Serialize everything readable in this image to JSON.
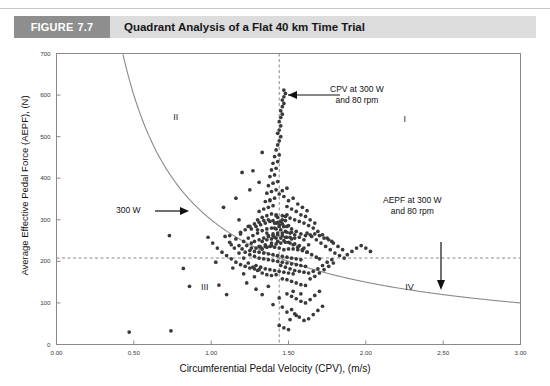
{
  "header": {
    "badge_word": "FIGURE",
    "badge_number": "7.7",
    "title": "Quadrant Analysis of a Flat 40 km Time Trial",
    "badge_color": "#8e8e8e",
    "band_color": "#dcdcdc"
  },
  "chart_data": {
    "type": "scatter",
    "title": "Quadrant Analysis of a Flat 40 km Time Trial",
    "xlabel": "Circumferential Pedal Velocity (CPV), (m/s)",
    "ylabel": "Average Effective Pedal Force (AEPF), (N)",
    "xlim": [
      0.0,
      3.0
    ],
    "ylim": [
      0,
      700
    ],
    "xticks": [
      "0.00",
      "0.50",
      "1.00",
      "1.50",
      "2.00",
      "2.50",
      "3.00"
    ],
    "xtick_values": [
      0.0,
      0.5,
      1.0,
      1.5,
      2.0,
      2.5,
      3.0
    ],
    "yticks": [
      "0",
      "100",
      "200",
      "300",
      "400",
      "500",
      "600",
      "700"
    ],
    "ytick_values": [
      0,
      100,
      200,
      300,
      400,
      500,
      600,
      700
    ],
    "grid": false,
    "legend": "none",
    "marker_color": "#3a3a3a",
    "marker_size_px": 2.6,
    "reference_lines": [
      {
        "name": "cpv-reference-line",
        "orientation": "vertical",
        "value": 1.44,
        "style": "dashed",
        "color": "#8a8a8a"
      },
      {
        "name": "aepf-reference-line",
        "orientation": "horizontal",
        "value": 208,
        "style": "dashed",
        "color": "#8a8a8a"
      }
    ],
    "curves": [
      {
        "name": "constant-power-300w",
        "label": "300 W",
        "equation": "AEPF = 300 / CPV",
        "power_watts": 300,
        "color": "#888888",
        "style": "solid"
      }
    ],
    "quadrant_labels": [
      {
        "label": "I",
        "cpv": 2.27,
        "aepf": 540
      },
      {
        "label": "II",
        "cpv": 0.78,
        "aepf": 545
      },
      {
        "label": "III",
        "cpv": 0.96,
        "aepf": 135
      },
      {
        "label": "IV",
        "cpv": 2.28,
        "aepf": 135
      }
    ],
    "annotations": [
      {
        "name": "cpv-annotation",
        "text_lines": [
          "CPV at 300 W",
          "and 80 rpm"
        ],
        "arrow": "left",
        "points_to": {
          "cpv": 1.44,
          "aepf": 595
        }
      },
      {
        "name": "aepf-annotation",
        "text_lines": [
          "AEPF at 300 W",
          "and 80 rpm"
        ],
        "arrow": "down",
        "points_to": {
          "cpv": 2.52,
          "aepf": 230
        }
      },
      {
        "name": "power-curve-annotation",
        "text_lines": [
          "300 W"
        ],
        "arrow": "right",
        "points_to": {
          "cpv": 0.8,
          "aepf": 300
        }
      }
    ],
    "points": [
      [
        0.47,
        30
      ],
      [
        0.74,
        33
      ],
      [
        0.86,
        140
      ],
      [
        1.05,
        143
      ],
      [
        0.73,
        262
      ],
      [
        0.82,
        183
      ],
      [
        1.03,
        198
      ],
      [
        1.14,
        184
      ],
      [
        1.21,
        170
      ],
      [
        1.28,
        163
      ],
      [
        1.1,
        120
      ],
      [
        1.33,
        120
      ],
      [
        1.4,
        96
      ],
      [
        1.46,
        90
      ],
      [
        1.49,
        78
      ],
      [
        1.52,
        84
      ],
      [
        1.55,
        70
      ],
      [
        1.51,
        60
      ],
      [
        1.44,
        112
      ],
      [
        1.37,
        140
      ],
      [
        1.29,
        133
      ],
      [
        1.23,
        148
      ],
      [
        1.53,
        128
      ],
      [
        1.58,
        122
      ],
      [
        1.12,
        262
      ],
      [
        1.18,
        300
      ],
      [
        1.08,
        330
      ],
      [
        1.16,
        352
      ],
      [
        1.25,
        372
      ],
      [
        1.2,
        414
      ],
      [
        1.27,
        418
      ],
      [
        1.33,
        462
      ],
      [
        1.31,
        390
      ],
      [
        1.38,
        346
      ],
      [
        1.42,
        310
      ],
      [
        1.46,
        300
      ],
      [
        1.41,
        258
      ],
      [
        1.36,
        268
      ],
      [
        1.3,
        276
      ],
      [
        1.24,
        284
      ],
      [
        1.19,
        270
      ],
      [
        1.13,
        240
      ],
      [
        1.26,
        232
      ],
      [
        1.31,
        236
      ],
      [
        1.35,
        240
      ],
      [
        1.39,
        244
      ],
      [
        1.43,
        248
      ],
      [
        1.47,
        250
      ],
      [
        1.5,
        246
      ],
      [
        1.53,
        240
      ],
      [
        1.56,
        234
      ],
      [
        1.59,
        228
      ],
      [
        1.62,
        222
      ],
      [
        1.65,
        216
      ],
      [
        1.68,
        210
      ],
      [
        1.7,
        206
      ],
      [
        1.63,
        240
      ],
      [
        1.6,
        252
      ],
      [
        1.57,
        258
      ],
      [
        1.54,
        264
      ],
      [
        1.51,
        268
      ],
      [
        1.48,
        272
      ],
      [
        1.45,
        276
      ],
      [
        1.42,
        278
      ],
      [
        1.39,
        280
      ],
      [
        1.36,
        278
      ],
      [
        1.33,
        274
      ],
      [
        1.3,
        268
      ],
      [
        1.27,
        262
      ],
      [
        1.24,
        256
      ],
      [
        1.21,
        248
      ],
      [
        1.18,
        238
      ],
      [
        1.22,
        222
      ],
      [
        1.25,
        216
      ],
      [
        1.28,
        212
      ],
      [
        1.31,
        208
      ],
      [
        1.34,
        206
      ],
      [
        1.37,
        204
      ],
      [
        1.4,
        202
      ],
      [
        1.43,
        200
      ],
      [
        1.46,
        198
      ],
      [
        1.49,
        196
      ],
      [
        1.52,
        194
      ],
      [
        1.55,
        192
      ],
      [
        1.58,
        190
      ],
      [
        1.61,
        188
      ],
      [
        1.29,
        190
      ],
      [
        1.32,
        186
      ],
      [
        1.35,
        182
      ],
      [
        1.38,
        180
      ],
      [
        1.41,
        178
      ],
      [
        1.44,
        176
      ],
      [
        1.47,
        174
      ],
      [
        1.5,
        172
      ],
      [
        1.53,
        170
      ],
      [
        1.33,
        230
      ],
      [
        1.36,
        234
      ],
      [
        1.39,
        238
      ],
      [
        1.42,
        242
      ],
      [
        1.45,
        244
      ],
      [
        1.48,
        246
      ],
      [
        1.51,
        244
      ],
      [
        1.54,
        242
      ],
      [
        1.57,
        238
      ],
      [
        1.6,
        232
      ],
      [
        1.26,
        244
      ],
      [
        1.23,
        238
      ],
      [
        1.2,
        230
      ],
      [
        1.34,
        256
      ],
      [
        1.37,
        260
      ],
      [
        1.4,
        262
      ],
      [
        1.43,
        264
      ],
      [
        1.46,
        262
      ],
      [
        1.49,
        258
      ],
      [
        1.52,
        254
      ],
      [
        1.31,
        252
      ],
      [
        1.28,
        248
      ],
      [
        1.35,
        292
      ],
      [
        1.38,
        296
      ],
      [
        1.41,
        292
      ],
      [
        1.44,
        288
      ],
      [
        1.47,
        284
      ],
      [
        1.32,
        288
      ],
      [
        1.29,
        284
      ],
      [
        1.26,
        278
      ],
      [
        1.36,
        310
      ],
      [
        1.39,
        314
      ],
      [
        1.42,
        312
      ],
      [
        1.33,
        306
      ],
      [
        1.3,
        300
      ],
      [
        1.37,
        330
      ],
      [
        1.4,
        334
      ],
      [
        1.34,
        326
      ],
      [
        1.31,
        320
      ],
      [
        1.38,
        348
      ],
      [
        1.35,
        344
      ],
      [
        1.41,
        352
      ],
      [
        1.36,
        364
      ],
      [
        1.39,
        368
      ],
      [
        1.42,
        372
      ],
      [
        1.37,
        382
      ],
      [
        1.4,
        388
      ],
      [
        1.43,
        392
      ],
      [
        1.38,
        404
      ],
      [
        1.41,
        408
      ],
      [
        1.39,
        420
      ],
      [
        1.42,
        424
      ],
      [
        1.4,
        436
      ],
      [
        1.43,
        440
      ],
      [
        1.41,
        452
      ],
      [
        1.44,
        456
      ],
      [
        1.42,
        468
      ],
      [
        1.43,
        480
      ],
      [
        1.44,
        490
      ],
      [
        1.45,
        500
      ],
      [
        1.43,
        508
      ],
      [
        1.44,
        516
      ],
      [
        1.45,
        526
      ],
      [
        1.44,
        536
      ],
      [
        1.45,
        546
      ],
      [
        1.46,
        554
      ],
      [
        1.45,
        562
      ],
      [
        1.46,
        572
      ],
      [
        1.47,
        580
      ],
      [
        1.46,
        588
      ],
      [
        1.47,
        596
      ],
      [
        1.48,
        604
      ],
      [
        1.47,
        612
      ],
      [
        1.62,
        268
      ],
      [
        1.65,
        260
      ],
      [
        1.68,
        252
      ],
      [
        1.71,
        244
      ],
      [
        1.74,
        236
      ],
      [
        1.77,
        228
      ],
      [
        1.8,
        220
      ],
      [
        1.83,
        214
      ],
      [
        1.86,
        208
      ],
      [
        1.75,
        256
      ],
      [
        1.78,
        248
      ],
      [
        1.72,
        264
      ],
      [
        1.69,
        272
      ],
      [
        1.66,
        280
      ],
      [
        1.63,
        286
      ],
      [
        1.6,
        292
      ],
      [
        1.57,
        296
      ],
      [
        1.54,
        300
      ],
      [
        1.51,
        304
      ],
      [
        1.48,
        308
      ],
      [
        1.58,
        312
      ],
      [
        1.61,
        308
      ],
      [
        1.64,
        300
      ],
      [
        1.67,
        292
      ],
      [
        1.55,
        320
      ],
      [
        1.52,
        326
      ],
      [
        1.49,
        332
      ],
      [
        1.56,
        338
      ],
      [
        1.59,
        330
      ],
      [
        1.62,
        322
      ],
      [
        1.5,
        346
      ],
      [
        1.53,
        352
      ],
      [
        1.47,
        356
      ],
      [
        1.44,
        362
      ],
      [
        1.46,
        370
      ],
      [
        1.49,
        376
      ],
      [
        1.45,
        190
      ],
      [
        1.48,
        186
      ],
      [
        1.51,
        182
      ],
      [
        1.54,
        178
      ],
      [
        1.57,
        176
      ],
      [
        1.6,
        174
      ],
      [
        1.63,
        172
      ],
      [
        1.66,
        176
      ],
      [
        1.69,
        182
      ],
      [
        1.72,
        190
      ],
      [
        1.75,
        198
      ],
      [
        1.78,
        204
      ],
      [
        1.42,
        168
      ],
      [
        1.39,
        166
      ],
      [
        1.36,
        168
      ],
      [
        1.33,
        172
      ],
      [
        1.3,
        178
      ],
      [
        1.27,
        186
      ],
      [
        1.24,
        196
      ],
      [
        1.21,
        208
      ],
      [
        1.18,
        220
      ],
      [
        1.15,
        232
      ],
      [
        1.12,
        246
      ],
      [
        1.09,
        260
      ],
      [
        1.52,
        152
      ],
      [
        1.55,
        148
      ],
      [
        1.58,
        144
      ],
      [
        1.61,
        142
      ],
      [
        1.49,
        156
      ],
      [
        1.46,
        158
      ],
      [
        1.64,
        158
      ],
      [
        1.67,
        164
      ],
      [
        1.7,
        172
      ],
      [
        1.73,
        180
      ],
      [
        1.76,
        188
      ],
      [
        1.79,
        196
      ],
      [
        1.55,
        110
      ],
      [
        1.58,
        104
      ],
      [
        1.61,
        100
      ],
      [
        1.52,
        116
      ],
      [
        1.49,
        122
      ],
      [
        1.64,
        108
      ],
      [
        1.67,
        118
      ],
      [
        1.7,
        128
      ],
      [
        1.57,
        66
      ],
      [
        1.6,
        58
      ],
      [
        1.54,
        74
      ],
      [
        1.63,
        62
      ],
      [
        1.66,
        72
      ],
      [
        1.69,
        82
      ],
      [
        1.72,
        92
      ],
      [
        1.44,
        46
      ],
      [
        1.47,
        40
      ],
      [
        1.5,
        36
      ],
      [
        1.88,
        216
      ],
      [
        1.91,
        224
      ],
      [
        1.94,
        232
      ],
      [
        1.97,
        238
      ],
      [
        2.0,
        232
      ],
      [
        2.03,
        224
      ],
      [
        1.85,
        228
      ],
      [
        1.82,
        236
      ],
      [
        1.79,
        244
      ],
      [
        1.76,
        252
      ],
      [
        1.73,
        256
      ],
      [
        1.7,
        262
      ],
      [
        1.67,
        266
      ],
      [
        1.64,
        264
      ],
      [
        1.61,
        262
      ],
      [
        1.58,
        266
      ],
      [
        1.55,
        272
      ],
      [
        1.52,
        278
      ],
      [
        1.49,
        284
      ],
      [
        1.46,
        290
      ],
      [
        1.43,
        294
      ],
      [
        1.4,
        298
      ],
      [
        1.37,
        300
      ],
      [
        1.34,
        298
      ],
      [
        1.31,
        294
      ],
      [
        1.28,
        290
      ],
      [
        1.25,
        284
      ],
      [
        1.22,
        276
      ],
      [
        1.19,
        266
      ],
      [
        1.16,
        254
      ],
      [
        1.43,
        214
      ],
      [
        1.46,
        212
      ],
      [
        1.49,
        210
      ],
      [
        1.52,
        208
      ],
      [
        1.55,
        206
      ],
      [
        1.58,
        204
      ],
      [
        1.4,
        216
      ],
      [
        1.37,
        218
      ],
      [
        1.34,
        220
      ],
      [
        1.31,
        222
      ],
      [
        1.28,
        224
      ],
      [
        1.25,
        226
      ],
      [
        1.47,
        228
      ],
      [
        1.5,
        230
      ],
      [
        1.53,
        230
      ],
      [
        1.56,
        228
      ],
      [
        1.59,
        226
      ],
      [
        1.62,
        222
      ],
      [
        1.44,
        232
      ],
      [
        1.41,
        234
      ],
      [
        1.38,
        236
      ],
      [
        1.35,
        236
      ],
      [
        1.32,
        234
      ],
      [
        1.29,
        232
      ],
      [
        1.45,
        256
      ],
      [
        1.48,
        258
      ],
      [
        1.51,
        258
      ],
      [
        1.54,
        256
      ],
      [
        1.42,
        256
      ],
      [
        1.39,
        254
      ],
      [
        1.36,
        252
      ],
      [
        1.33,
        248
      ],
      [
        1.46,
        268
      ],
      [
        1.49,
        270
      ],
      [
        1.52,
        270
      ],
      [
        1.43,
        268
      ],
      [
        1.4,
        266
      ],
      [
        1.37,
        262
      ],
      [
        1.47,
        284
      ],
      [
        1.5,
        286
      ],
      [
        1.44,
        284
      ],
      [
        1.41,
        280
      ],
      [
        1.48,
        298
      ],
      [
        1.45,
        296
      ],
      [
        1.42,
        292
      ],
      [
        1.49,
        312
      ],
      [
        1.46,
        310
      ],
      [
        1.43,
        306
      ],
      [
        1.16,
        198
      ],
      [
        1.13,
        206
      ],
      [
        1.1,
        214
      ],
      [
        1.07,
        222
      ],
      [
        1.04,
        232
      ],
      [
        1.01,
        244
      ],
      [
        0.98,
        258
      ],
      [
        1.19,
        192
      ],
      [
        1.22,
        188
      ],
      [
        1.25,
        184
      ],
      [
        1.28,
        182
      ],
      [
        1.31,
        180
      ]
    ]
  }
}
